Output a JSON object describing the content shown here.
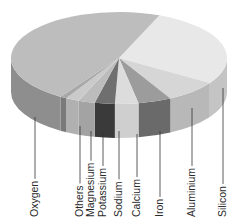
{
  "chart_data": {
    "type": "pie",
    "title": "",
    "style": "3d-exploded-none",
    "categories": [
      "Oxygen",
      "Silicon",
      "Aluminium",
      "Iron",
      "Calcium",
      "Sodium",
      "Potassium",
      "Magnesium",
      "Others"
    ],
    "values": [
      47,
      28,
      8,
      5,
      3.5,
      3,
      2.5,
      2,
      1
    ],
    "unit": "%",
    "colors": {
      "Oxygen": {
        "top": "#bdbdbd",
        "side": "#8e8e8e"
      },
      "Silicon": {
        "top": "#e8e8e8",
        "side": "#c4c4c4"
      },
      "Aluminium": {
        "top": "#d6d6d6",
        "side": "#b8b8b8"
      },
      "Iron": {
        "top": "#9c9c9c",
        "side": "#6a6a6a"
      },
      "Calcium": {
        "top": "#dcdcdc",
        "side": "#cfcfcf"
      },
      "Sodium": {
        "top": "#6f6f6f",
        "side": "#3a3a3a"
      },
      "Potassium": {
        "top": "#bcbcbc",
        "side": "#a3a3a3"
      },
      "Magnesium": {
        "top": "#cacaca",
        "side": "#b0b0b0"
      },
      "Others": {
        "top": "#a8a8a8",
        "side": "#7a7a7a"
      }
    },
    "legend": "leader-lines-with-rotated-labels-below"
  },
  "labels": [
    {
      "text": "Oxygen",
      "x": 35,
      "lineTop": 117
    },
    {
      "text": "Others",
      "x": 80,
      "lineTop": 126
    },
    {
      "text": "Magnesium",
      "x": 91,
      "lineTop": 131
    },
    {
      "text": "Potassium",
      "x": 103,
      "lineTop": 131
    },
    {
      "text": "Sodium",
      "x": 119,
      "lineTop": 131
    },
    {
      "text": "Calcium",
      "x": 137,
      "lineTop": 134
    },
    {
      "text": "Iron",
      "x": 160,
      "lineTop": 131
    },
    {
      "text": "Aluminium",
      "x": 192,
      "lineTop": 108
    },
    {
      "text": "Silicon",
      "x": 223,
      "lineTop": 88
    }
  ]
}
